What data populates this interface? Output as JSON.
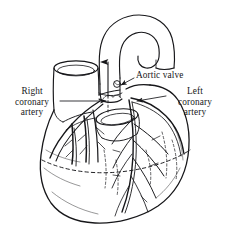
{
  "figure": {
    "type": "anatomical-line-drawing",
    "background_color": "#ffffff",
    "ink_color": "#1a1a1a",
    "labels": [
      {
        "id": "right-coronary-artery",
        "lines": [
          "Right",
          "coronary",
          "artery"
        ],
        "position": "left",
        "leader": "horizontal line with arrowhead pointing right"
      },
      {
        "id": "aortic-valve",
        "lines": [
          "Aortic valve"
        ],
        "position": "top-right",
        "leader": "line angling down-left to valve"
      },
      {
        "id": "left-coronary-artery",
        "lines": [
          "Left",
          "coronary",
          "artery"
        ],
        "position": "right",
        "leader": "horizontal line with arrowhead pointing left"
      }
    ],
    "structures": [
      "aortic arch",
      "ascending aorta",
      "descending aorta",
      "superior vena cava",
      "pulmonary trunk",
      "right atrium",
      "right ventricle",
      "left ventricle",
      "aortic valve",
      "coronary sulcus (dashed)",
      "coronary artery branches"
    ],
    "flow_arrow": {
      "id": "blood-flow-arrow",
      "direction": "up",
      "description": "arrow through aortic valve indicating outflow"
    }
  }
}
